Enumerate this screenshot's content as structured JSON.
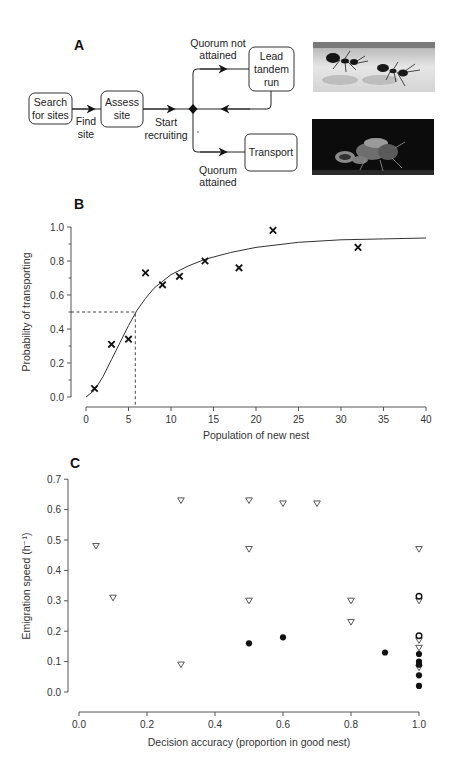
{
  "panel_a": {
    "letter": "A",
    "nodes": {
      "search": [
        "Search",
        "for sites"
      ],
      "assess": [
        "Assess",
        "site"
      ],
      "lead": [
        "Lead",
        "tandem",
        "run"
      ],
      "transport": [
        "Transport"
      ]
    },
    "edges": {
      "find_site": [
        "Find",
        "site"
      ],
      "start_recruiting": [
        "Start",
        "recruiting"
      ],
      "quorum_not": [
        "Quorum not",
        "attained"
      ],
      "quorum_yes": [
        "Quorum",
        "attained"
      ]
    },
    "photos": [
      {
        "name": "tandem-run-photo",
        "description": "two ants in tandem run"
      },
      {
        "name": "transport-photo",
        "description": "ant carrying nestmate"
      }
    ]
  },
  "panel_b": {
    "letter": "B",
    "ylabel": "Probability of transporting",
    "xlabel": "Population of new nest",
    "yticks": [
      "0.0",
      "0.2",
      "0.4",
      "0.6",
      "0.8",
      "1.0"
    ],
    "xticks": [
      "0",
      "5",
      "10",
      "15",
      "20",
      "25",
      "30",
      "35",
      "40"
    ]
  },
  "panel_c": {
    "letter": "C",
    "ylabel": "Emigration speed (h⁻¹)",
    "xlabel": "Decision accuracy (proportion in good nest)",
    "yticks": [
      "0.0",
      "0.1",
      "0.2",
      "0.3",
      "0.4",
      "0.5",
      "0.6",
      "0.7"
    ],
    "xticks": [
      "0.0",
      "0.2",
      "0.4",
      "0.6",
      "0.8",
      "1.0"
    ]
  },
  "chart_data": [
    {
      "type": "diagram",
      "title": "A",
      "nodes": [
        "Search for sites",
        "Assess site",
        "Lead tandem run",
        "Transport"
      ],
      "edges": [
        {
          "from": "Search for sites",
          "to": "Assess site",
          "label": "Find site"
        },
        {
          "from": "Assess site",
          "to": "decision",
          "label": "Start recruiting"
        },
        {
          "from": "decision",
          "to": "Lead tandem run",
          "label": "Quorum not attained"
        },
        {
          "from": "Lead tandem run",
          "to": "decision",
          "label": ""
        },
        {
          "from": "decision",
          "to": "Transport",
          "label": "Quorum attained"
        }
      ]
    },
    {
      "type": "scatter",
      "title": "B",
      "xlabel": "Population of new nest",
      "ylabel": "Probability of transporting",
      "xlim": [
        0,
        40
      ],
      "ylim": [
        0,
        1.0
      ],
      "grid": false,
      "series": [
        {
          "name": "observed",
          "marker": "x",
          "x": [
            1,
            3,
            5,
            7,
            9,
            11,
            14,
            18,
            22,
            32
          ],
          "y": [
            0.05,
            0.31,
            0.34,
            0.73,
            0.66,
            0.71,
            0.8,
            0.76,
            0.98,
            0.88
          ]
        },
        {
          "name": "fitted curve",
          "type": "line",
          "x": [
            0,
            1,
            2,
            3,
            4,
            5,
            6,
            7,
            8,
            10,
            12,
            14,
            17,
            20,
            25,
            30,
            35,
            40
          ],
          "y": [
            0.0,
            0.04,
            0.12,
            0.22,
            0.32,
            0.42,
            0.51,
            0.58,
            0.64,
            0.72,
            0.77,
            0.81,
            0.85,
            0.88,
            0.91,
            0.925,
            0.93,
            0.935
          ]
        }
      ],
      "annotations": [
        {
          "type": "dashed-guide",
          "x": 5.8,
          "y": 0.5
        }
      ]
    },
    {
      "type": "scatter",
      "title": "C",
      "xlabel": "Decision accuracy (proportion in good nest)",
      "ylabel": "Emigration speed (h⁻¹)",
      "xlim": [
        0,
        1.0
      ],
      "ylim": [
        0,
        0.7
      ],
      "grid": false,
      "series": [
        {
          "name": "open triangles",
          "marker": "triangle-down-open",
          "x": [
            0.05,
            0.1,
            0.3,
            0.3,
            0.5,
            0.5,
            0.5,
            0.6,
            0.7,
            0.8,
            0.8,
            1.0,
            1.0,
            1.0,
            1.0,
            1.0
          ],
          "y": [
            0.48,
            0.31,
            0.63,
            0.09,
            0.63,
            0.47,
            0.3,
            0.62,
            0.62,
            0.3,
            0.23,
            0.47,
            0.3,
            0.17,
            0.145,
            0.08
          ]
        },
        {
          "name": "filled circles",
          "marker": "circle-filled",
          "x": [
            0.5,
            0.6,
            0.9,
            1.0,
            1.0,
            1.0,
            1.0,
            1.0
          ],
          "y": [
            0.16,
            0.18,
            0.13,
            0.125,
            0.1,
            0.09,
            0.055,
            0.02
          ]
        },
        {
          "name": "open circles",
          "marker": "circle-open",
          "x": [
            1.0,
            1.0
          ],
          "y": [
            0.315,
            0.185
          ]
        }
      ]
    }
  ]
}
